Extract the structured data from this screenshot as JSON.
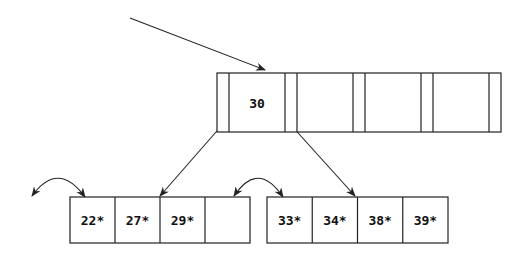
{
  "diagram": {
    "type": "B+ tree",
    "root": {
      "keys": [
        "30",
        "",
        "",
        ""
      ],
      "x": 217,
      "y": 73,
      "height": 59,
      "pointer_width": 12,
      "key_width": 56
    },
    "leaves": [
      {
        "name": "left-leaf",
        "entries": [
          "22*",
          "27*",
          "29*",
          ""
        ],
        "x": 70,
        "y": 197,
        "cell_width": 45,
        "height": 46
      },
      {
        "name": "right-leaf",
        "entries": [
          "33*",
          "34*",
          "38*",
          "39*"
        ],
        "x": 267,
        "y": 197,
        "cell_width": 45.25,
        "height": 46
      }
    ],
    "edges": [
      {
        "name": "entry-arrow",
        "from": [
          130,
          18
        ],
        "to": [
          265,
          70
        ]
      },
      {
        "name": "root-to-left-leaf-arrow",
        "from": [
          223,
          124
        ],
        "to": [
          160,
          196
        ]
      },
      {
        "name": "root-to-right-leaf-arrow",
        "from": [
          290,
          124
        ],
        "to": [
          355,
          196
        ]
      }
    ],
    "sibling_links": [
      {
        "name": "left-leaf-prev-link",
        "start": [
          32,
          196
        ],
        "ctrl": [
          58,
          160
        ],
        "end": [
          85,
          197
        ]
      },
      {
        "name": "leaf-sibling-link",
        "start": [
          234,
          196
        ],
        "ctrl": [
          258,
          160
        ],
        "end": [
          283,
          197
        ]
      }
    ],
    "colors": {
      "stroke": "#222222",
      "background": "#ffffff"
    }
  }
}
